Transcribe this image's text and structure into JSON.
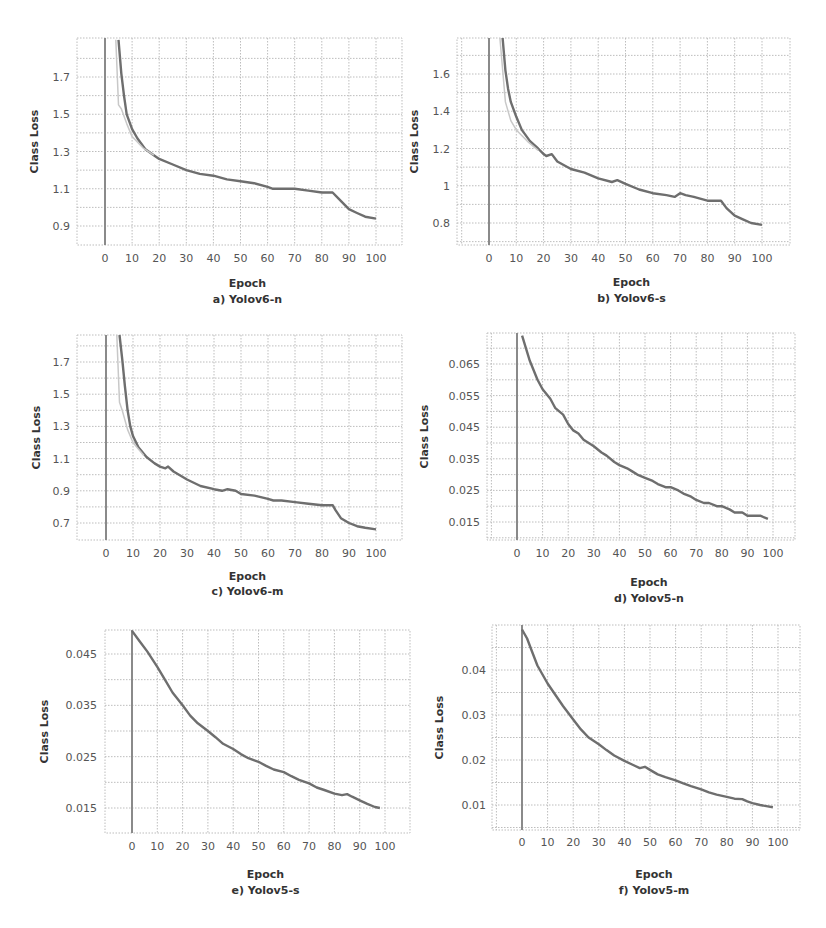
{
  "figure": {
    "colors": {
      "grid": "#bdbdbd",
      "line": "#6e6e6e",
      "line_light": "#c8c8c8",
      "axis_v": "#8a8a8a",
      "text": "#555555"
    }
  },
  "chart_data": [
    {
      "id": "a",
      "type": "line",
      "title": "a) Yolov6-n",
      "xlabel": "Epoch",
      "ylabel": "Class Loss",
      "xticks": [
        0,
        10,
        20,
        30,
        40,
        50,
        60,
        70,
        80,
        90,
        100
      ],
      "yticks": [
        0.9,
        1.1,
        1.3,
        1.5,
        1.7
      ],
      "ytick_labels": [
        "0.9",
        "1.1",
        "1.3",
        "1.5",
        "1.7"
      ],
      "xlim": [
        -10,
        108
      ],
      "ylim": [
        0.8,
        1.9
      ],
      "grid": true,
      "layout": {
        "plot": [
          77,
          38,
          402,
          245
        ],
        "x0px": 105,
        "x100px": 376,
        "yA": [
          1.7,
          77
        ],
        "yB": [
          0.9,
          226
        ],
        "tick_y": 262,
        "ylabel_x": 38,
        "ytick_x": 70,
        "xlabel_y": 287,
        "caption_y": 303
      },
      "series": [
        {
          "name": "train",
          "x": [
            5,
            6,
            7,
            8,
            10,
            12,
            15,
            18,
            20,
            25,
            30,
            35,
            40,
            45,
            50,
            55,
            60,
            62,
            65,
            70,
            75,
            80,
            83,
            84,
            86,
            88,
            90,
            93,
            96,
            100
          ],
          "values": [
            1.9,
            1.72,
            1.6,
            1.5,
            1.42,
            1.37,
            1.31,
            1.28,
            1.26,
            1.23,
            1.2,
            1.18,
            1.17,
            1.15,
            1.14,
            1.13,
            1.11,
            1.1,
            1.1,
            1.1,
            1.09,
            1.08,
            1.08,
            1.08,
            1.05,
            1.02,
            0.99,
            0.97,
            0.95,
            0.94
          ]
        },
        {
          "name": "val",
          "light": true,
          "x": [
            4,
            5,
            6,
            8,
            10,
            14,
            18
          ],
          "values": [
            1.9,
            1.55,
            1.53,
            1.45,
            1.38,
            1.32,
            1.28
          ]
        }
      ]
    },
    {
      "id": "b",
      "type": "line",
      "title": "b) Yolov6-s",
      "xlabel": "Epoch",
      "ylabel": "Class Loss",
      "xticks": [
        0,
        10,
        20,
        30,
        40,
        50,
        60,
        70,
        80,
        90,
        100
      ],
      "yticks": [
        0.8,
        1.0,
        1.2,
        1.4,
        1.6
      ],
      "ytick_labels": [
        "0.8",
        "1",
        "1.2",
        "1.4",
        "1.6"
      ],
      "xlim": [
        -10,
        108
      ],
      "ylim": [
        0.7,
        1.8
      ],
      "grid": true,
      "layout": {
        "plot": [
          457,
          38,
          790,
          245
        ],
        "x0px": 489,
        "x100px": 762,
        "yA": [
          1.6,
          74
        ],
        "yB": [
          0.8,
          223
        ],
        "tick_y": 262,
        "ylabel_x": 418,
        "ytick_x": 450,
        "xlabel_y": 286,
        "caption_y": 302
      },
      "series": [
        {
          "name": "train",
          "x": [
            5,
            6,
            7,
            8,
            10,
            12,
            15,
            18,
            20,
            21,
            23,
            25,
            30,
            35,
            40,
            45,
            47,
            50,
            55,
            60,
            65,
            68,
            70,
            72,
            75,
            80,
            85,
            87,
            90,
            93,
            96,
            100
          ],
          "values": [
            1.8,
            1.62,
            1.52,
            1.45,
            1.37,
            1.3,
            1.24,
            1.2,
            1.17,
            1.16,
            1.17,
            1.13,
            1.09,
            1.07,
            1.04,
            1.02,
            1.03,
            1.01,
            0.98,
            0.96,
            0.95,
            0.94,
            0.96,
            0.95,
            0.94,
            0.92,
            0.92,
            0.88,
            0.84,
            0.82,
            0.8,
            0.79
          ]
        },
        {
          "name": "val",
          "light": true,
          "x": [
            4,
            6,
            8,
            10,
            14,
            18
          ],
          "values": [
            1.8,
            1.45,
            1.35,
            1.3,
            1.24,
            1.19
          ]
        }
      ]
    },
    {
      "id": "c",
      "type": "line",
      "title": "c) Yolov6-m",
      "xlabel": "Epoch",
      "ylabel": "Class Loss",
      "xticks": [
        0,
        10,
        20,
        30,
        40,
        50,
        60,
        70,
        80,
        90,
        100
      ],
      "yticks": [
        0.7,
        0.9,
        1.1,
        1.3,
        1.5,
        1.7
      ],
      "ytick_labels": [
        "0.7",
        "0.9",
        "1.1",
        "1.3",
        "1.5",
        "1.7"
      ],
      "xlim": [
        -10,
        108
      ],
      "ylim": [
        0.6,
        1.87
      ],
      "grid": true,
      "layout": {
        "plot": [
          77,
          335,
          402,
          540
        ],
        "x0px": 106,
        "x100px": 376,
        "yA": [
          1.7,
          362
        ],
        "yB": [
          0.7,
          523
        ],
        "tick_y": 557,
        "ylabel_x": 40,
        "ytick_x": 70,
        "xlabel_y": 580,
        "caption_y": 595
      },
      "series": [
        {
          "name": "train",
          "x": [
            5,
            6,
            7,
            8,
            9,
            10,
            12,
            15,
            18,
            20,
            22,
            23,
            25,
            30,
            35,
            40,
            43,
            45,
            48,
            50,
            55,
            60,
            62,
            65,
            70,
            75,
            80,
            84,
            85,
            87,
            90,
            93,
            96,
            100
          ],
          "values": [
            1.87,
            1.72,
            1.55,
            1.4,
            1.3,
            1.24,
            1.17,
            1.11,
            1.07,
            1.05,
            1.04,
            1.05,
            1.02,
            0.97,
            0.93,
            0.91,
            0.9,
            0.91,
            0.9,
            0.88,
            0.87,
            0.85,
            0.84,
            0.84,
            0.83,
            0.82,
            0.81,
            0.81,
            0.78,
            0.73,
            0.7,
            0.68,
            0.67,
            0.66
          ]
        },
        {
          "name": "val",
          "light": true,
          "x": [
            4,
            5,
            6,
            8,
            10,
            14
          ],
          "values": [
            1.87,
            1.45,
            1.4,
            1.28,
            1.2,
            1.12
          ]
        }
      ]
    },
    {
      "id": "d",
      "type": "line",
      "title": "d) Yolov5-n",
      "xlabel": "Epoch",
      "ylabel": "Class Loss",
      "xticks": [
        0,
        10,
        20,
        30,
        40,
        50,
        60,
        70,
        80,
        90,
        100
      ],
      "yticks": [
        0.015,
        0.025,
        0.035,
        0.045,
        0.055,
        0.065
      ],
      "ytick_labels": [
        "0.015",
        "0.025",
        "0.035",
        "0.045",
        "0.055",
        "0.065"
      ],
      "xlim": [
        -11,
        108
      ],
      "ylim": [
        0.01,
        0.075
      ],
      "grid": true,
      "layout": {
        "plot": [
          487,
          333,
          795,
          540
        ],
        "x0px": 517,
        "x100px": 773,
        "yA": [
          0.065,
          364
        ],
        "yB": [
          0.015,
          522
        ],
        "tick_y": 557,
        "ylabel_x": 428,
        "ytick_x": 480,
        "xlabel_y": 586,
        "caption_y": 602
      },
      "series": [
        {
          "name": "train",
          "x": [
            2,
            5,
            8,
            10,
            13,
            15,
            18,
            20,
            22,
            24,
            26,
            28,
            30,
            33,
            35,
            38,
            40,
            43,
            45,
            47,
            50,
            53,
            55,
            58,
            60,
            63,
            65,
            68,
            70,
            73,
            75,
            78,
            80,
            83,
            85,
            88,
            90,
            93,
            95,
            98
          ],
          "values": [
            0.074,
            0.066,
            0.06,
            0.057,
            0.054,
            0.051,
            0.049,
            0.046,
            0.044,
            0.043,
            0.041,
            0.04,
            0.039,
            0.037,
            0.036,
            0.034,
            0.033,
            0.032,
            0.031,
            0.03,
            0.029,
            0.028,
            0.027,
            0.026,
            0.026,
            0.025,
            0.024,
            0.023,
            0.022,
            0.021,
            0.021,
            0.02,
            0.02,
            0.019,
            0.018,
            0.018,
            0.017,
            0.017,
            0.017,
            0.016
          ]
        }
      ]
    },
    {
      "id": "e",
      "type": "line",
      "title": "e) Yolov5-s",
      "xlabel": "Epoch",
      "ylabel": "Class Loss",
      "xticks": [
        0,
        10,
        20,
        30,
        40,
        50,
        60,
        70,
        80,
        90,
        100
      ],
      "yticks": [
        0.015,
        0.025,
        0.035,
        0.045
      ],
      "ytick_labels": [
        "0.015",
        "0.025",
        "0.035",
        "0.045"
      ],
      "xlim": [
        -11,
        108
      ],
      "ylim": [
        0.01,
        0.05
      ],
      "grid": true,
      "layout": {
        "plot": [
          105,
          630,
          410,
          833
        ],
        "x0px": 132,
        "x100px": 385,
        "yA": [
          0.045,
          654
        ],
        "yB": [
          0.015,
          808
        ],
        "tick_y": 850,
        "ylabel_x": 48,
        "ytick_x": 97,
        "xlabel_y": 878,
        "caption_y": 894
      },
      "series": [
        {
          "name": "train",
          "x": [
            0,
            3,
            6,
            10,
            13,
            16,
            20,
            23,
            26,
            30,
            33,
            36,
            40,
            43,
            46,
            50,
            53,
            56,
            60,
            63,
            66,
            70,
            73,
            76,
            80,
            83,
            85,
            87,
            90,
            93,
            96,
            98
          ],
          "values": [
            0.0495,
            0.0475,
            0.0455,
            0.0425,
            0.04,
            0.0375,
            0.035,
            0.033,
            0.0315,
            0.03,
            0.0288,
            0.0275,
            0.0265,
            0.0255,
            0.0247,
            0.024,
            0.0232,
            0.0225,
            0.022,
            0.0212,
            0.0205,
            0.0198,
            0.019,
            0.0185,
            0.0178,
            0.0175,
            0.0177,
            0.0172,
            0.0165,
            0.0158,
            0.0152,
            0.015
          ]
        }
      ]
    },
    {
      "id": "f",
      "type": "line",
      "title": "f) Yolov5-m",
      "xlabel": "Epoch",
      "ylabel": "Class Loss",
      "xticks": [
        0,
        10,
        20,
        30,
        40,
        50,
        60,
        70,
        80,
        90,
        100
      ],
      "yticks": [
        0.01,
        0.02,
        0.03,
        0.04
      ],
      "ytick_labels": [
        "0.01",
        "0.02",
        "0.03",
        "0.04"
      ],
      "xlim": [
        -11,
        108
      ],
      "ylim": [
        0.005,
        0.049
      ],
      "grid": true,
      "layout": {
        "plot": [
          492,
          625,
          800,
          830
        ],
        "x0px": 522,
        "x100px": 778,
        "yA": [
          0.04,
          670
        ],
        "yB": [
          0.01,
          805
        ],
        "tick_y": 846,
        "ylabel_x": 443,
        "ytick_x": 486,
        "xlabel_y": 878,
        "caption_y": 894
      },
      "series": [
        {
          "name": "train",
          "x": [
            0,
            2,
            4,
            6,
            8,
            10,
            13,
            16,
            20,
            23,
            26,
            30,
            33,
            36,
            40,
            43,
            46,
            48,
            50,
            53,
            56,
            60,
            63,
            66,
            70,
            73,
            76,
            80,
            83,
            86,
            88,
            90,
            93,
            96,
            98
          ],
          "values": [
            0.049,
            0.047,
            0.044,
            0.041,
            0.039,
            0.037,
            0.0345,
            0.032,
            0.029,
            0.0268,
            0.025,
            0.0235,
            0.0222,
            0.021,
            0.0198,
            0.019,
            0.0182,
            0.0185,
            0.0178,
            0.0168,
            0.0162,
            0.0155,
            0.0148,
            0.0142,
            0.0135,
            0.0128,
            0.0123,
            0.0118,
            0.0114,
            0.0113,
            0.0108,
            0.0104,
            0.01,
            0.0097,
            0.0095
          ]
        }
      ]
    }
  ]
}
